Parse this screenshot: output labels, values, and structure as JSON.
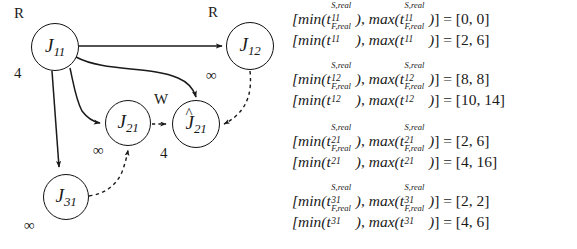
{
  "figure": {
    "ink_color": "#1a1a1a"
  },
  "graph": {
    "nodes": [
      {
        "id": "J11",
        "base": "J",
        "sub": "11",
        "hat": "",
        "top_tag": "R",
        "bottom_tag": "4",
        "cx": 55,
        "cy": 47,
        "r": 24
      },
      {
        "id": "J12",
        "base": "J",
        "sub": "12",
        "hat": "",
        "top_tag": "R",
        "bottom_tag": "∞",
        "cx": 250,
        "cy": 46,
        "r": 24
      },
      {
        "id": "J21",
        "base": "J",
        "sub": "21",
        "hat": "",
        "top_tag": "",
        "bottom_tag": "∞",
        "cx": 128,
        "cy": 123,
        "r": 23
      },
      {
        "id": "J21hat",
        "base": "J",
        "sub": "21",
        "hat": "^",
        "top_tag": "W",
        "bottom_tag": "4",
        "cx": 196,
        "cy": 124,
        "r": 24
      },
      {
        "id": "J31",
        "base": "J",
        "sub": "31",
        "hat": "",
        "top_tag": "",
        "bottom_tag": "∞",
        "cx": 66,
        "cy": 197,
        "r": 23
      }
    ],
    "edges": [
      {
        "from": "J11",
        "to": "J12",
        "style": "solid"
      },
      {
        "from": "J11",
        "to": "J21hat",
        "style": "solid"
      },
      {
        "from": "J11",
        "to": "J21",
        "style": "solid"
      },
      {
        "from": "J11",
        "to": "J31",
        "style": "solid"
      },
      {
        "from": "J21",
        "to": "J21hat",
        "style": "dashed"
      },
      {
        "from": "J12",
        "to": "J21hat",
        "style": "dashed"
      },
      {
        "from": "J31",
        "to": "J21",
        "style": "dashed"
      }
    ]
  },
  "equations": {
    "groups": [
      {
        "job": "11",
        "lines": [
          {
            "kind": "S",
            "sup": "S,real",
            "sub": "11",
            "value": "[0, 0]"
          },
          {
            "kind": "F",
            "sup": "F,real",
            "sub": "11",
            "value": "[2, 6]"
          }
        ]
      },
      {
        "job": "12",
        "lines": [
          {
            "kind": "S",
            "sup": "S,real",
            "sub": "12",
            "value": "[8, 8]"
          },
          {
            "kind": "F",
            "sup": "F,real",
            "sub": "12",
            "value": "[10, 14]"
          }
        ]
      },
      {
        "job": "21",
        "lines": [
          {
            "kind": "S",
            "sup": "S,real",
            "sub": "21",
            "value": "[2, 6]"
          },
          {
            "kind": "F",
            "sup": "F,real",
            "sub": "21",
            "value": "[4, 16]"
          }
        ]
      },
      {
        "job": "31",
        "lines": [
          {
            "kind": "S",
            "sup": "S,real",
            "sub": "31",
            "value": "[2, 2]"
          },
          {
            "kind": "F",
            "sup": "F,real",
            "sub": "31",
            "value": "[4, 6]"
          }
        ]
      }
    ],
    "tokens": {
      "open_bracket": "[",
      "min": "min",
      "max": "max",
      "t": "t",
      "lparen": "(",
      "rparen": ")",
      "comma": ", ",
      "close_bracket": "]",
      "equals": " = "
    }
  }
}
